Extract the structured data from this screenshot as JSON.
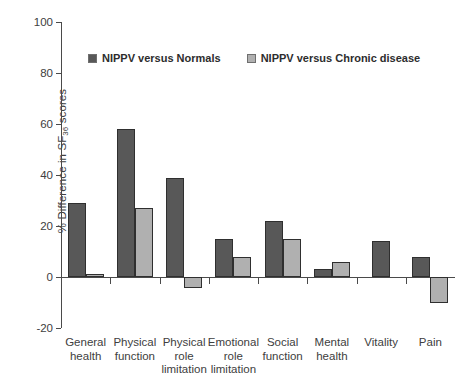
{
  "chart_data": {
    "type": "bar",
    "title": "",
    "subtitle": "",
    "xlabel": "",
    "ylabel": "% Difference in SF36 scores",
    "ylabel_parts": {
      "prefix": "% Difference in SF",
      "subscript": "36",
      "suffix": " scores"
    },
    "ylim": [
      -20,
      100
    ],
    "ytick_labels": [
      "100",
      "80",
      "60",
      "40",
      "20",
      "0",
      "-20"
    ],
    "ytick_values": [
      100,
      80,
      60,
      40,
      20,
      0,
      -20
    ],
    "grid": false,
    "legend_position": "upper-left-inside",
    "categories": [
      "General health",
      "Physical function",
      "Physical role limitation",
      "Emotional role limitation",
      "Social function",
      "Mental health",
      "Vitality",
      "Pain"
    ],
    "category_label_lines": [
      [
        "General",
        "health"
      ],
      [
        "Physical",
        "function"
      ],
      [
        "Physical",
        "role",
        "limitation"
      ],
      [
        "Emotional",
        "role",
        "limitation"
      ],
      [
        "Social",
        "function"
      ],
      [
        "Mental",
        "health"
      ],
      [
        "Vitality"
      ],
      [
        "Pain"
      ]
    ],
    "series": [
      {
        "name": "NIPPV versus Normals",
        "color": "#585858",
        "values": [
          29,
          58,
          39,
          15,
          22,
          3,
          14,
          8
        ]
      },
      {
        "name": "NIPPV versus Chronic disease",
        "color": "#b0b0b0",
        "values": [
          1,
          27,
          -4.5,
          8,
          15,
          6,
          null,
          -10
        ]
      }
    ]
  },
  "legend": {
    "items": [
      {
        "label": "NIPPV versus Normals",
        "swatch": "dark-swatch-icon"
      },
      {
        "label": "NIPPV versus Chronic disease",
        "swatch": "light-swatch-icon"
      }
    ]
  },
  "colors": {
    "series_normals": "#585858",
    "series_chronic": "#b0b0b0",
    "axis": "#4a4a4a",
    "text": "#404040",
    "background": "#ffffff"
  }
}
